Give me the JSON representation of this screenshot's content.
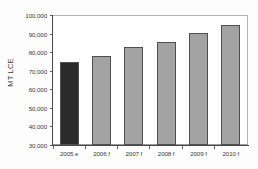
{
  "chart_data": {
    "type": "bar",
    "title": "",
    "subtitle": "",
    "xlabel": "",
    "ylabel": "MT LCE",
    "categories": [
      "2005 e",
      "2006 f",
      "2007 f",
      "2008 f",
      "2009 f",
      "2010 f"
    ],
    "values": [
      75000,
      78500,
      83000,
      86000,
      91000,
      95000
    ],
    "ylim": [
      30000,
      100000
    ],
    "ytick_values": [
      30000,
      40000,
      50000,
      60000,
      70000,
      80000,
      90000,
      100000
    ],
    "ytick_labels": [
      "30,000",
      "40,000",
      "50,000",
      "60,000",
      "70,000",
      "80,000",
      "90,000",
      "100,000"
    ],
    "grid": false,
    "legend": null,
    "legend_position": "none",
    "series": [
      {
        "name": "MT LCE",
        "values": [
          75000,
          78500,
          83000,
          86000,
          91000,
          95000
        ]
      }
    ],
    "bar_colors": [
      "#2b2b2b",
      "#a3a3a3",
      "#a3a3a3",
      "#a3a3a3",
      "#a3a3a3",
      "#a3a3a3"
    ],
    "bar_border_color": "#4f4f4f",
    "plot_background": "#ffffff",
    "figure_background": "#fdfdfd",
    "axis_color": "#4a4a4a",
    "text_color": "#3a3a3a"
  }
}
